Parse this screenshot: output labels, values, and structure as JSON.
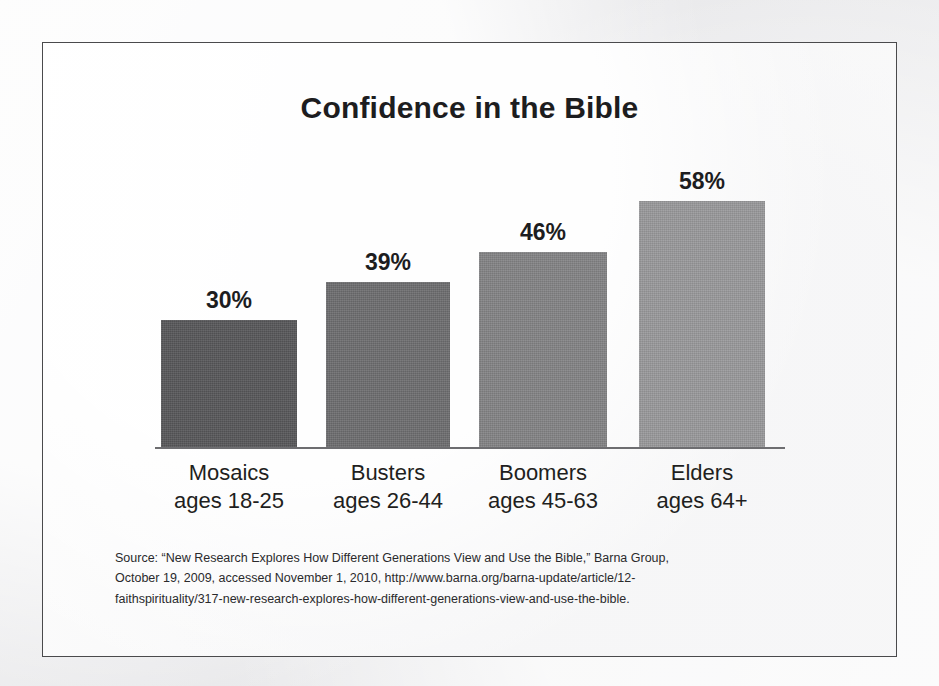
{
  "slide": {
    "title": "Confidence in the Bible",
    "frame_border_color": "#4a4a4c",
    "background_color": "#fbfbfb"
  },
  "chart_data": {
    "type": "bar",
    "title": "Confidence in the Bible",
    "xlabel": "",
    "ylabel": "",
    "ylim": [
      0,
      65
    ],
    "grid": false,
    "legend": "none",
    "categories": [
      "Mosaics",
      "Busters",
      "Boomers",
      "Elders"
    ],
    "category_sublabels": [
      "ages 18-25",
      "ages 26-44",
      "ages 45-63",
      "ages 64+"
    ],
    "values": [
      30,
      39,
      46,
      58
    ],
    "value_labels": [
      "30%",
      "39%",
      "46%",
      "58%"
    ],
    "bar_colors": [
      "#58585a",
      "#6e6e70",
      "#848486",
      "#9a9a9c"
    ]
  },
  "source": {
    "line1": "Source: “New Research Explores How Different Generations View and Use the Bible,” Barna Group,",
    "line2": "October 19, 2009, accessed November 1, 2010, http://www.barna.org/barna-update/article/12-",
    "line3": "faithspirituality/317-new-research-explores-how-different-generations-view-and-use-the-bible."
  }
}
